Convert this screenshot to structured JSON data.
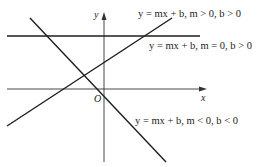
{
  "diagram": {
    "title": "",
    "axes": {
      "x_label": "x",
      "y_label": "y",
      "origin_label": "O"
    },
    "lines": [
      {
        "id": "positive-slope",
        "equation": "y = mx + b",
        "condition": "m > 0, b > 0",
        "label": "y = mx + b, m > 0, b > 0"
      },
      {
        "id": "zero-slope",
        "equation": "y = mx + b",
        "condition": "m = 0, b > 0",
        "label": "y = mx + b, m = 0, b > 0"
      },
      {
        "id": "negative-slope",
        "equation": "y = mx + b",
        "condition": "m < 0, b < 0",
        "label": "y = mx + b, m < 0, b < 0"
      }
    ],
    "colors": {
      "line": "#1e1e1e",
      "axis": "#333333",
      "background": "#ffffff"
    }
  }
}
